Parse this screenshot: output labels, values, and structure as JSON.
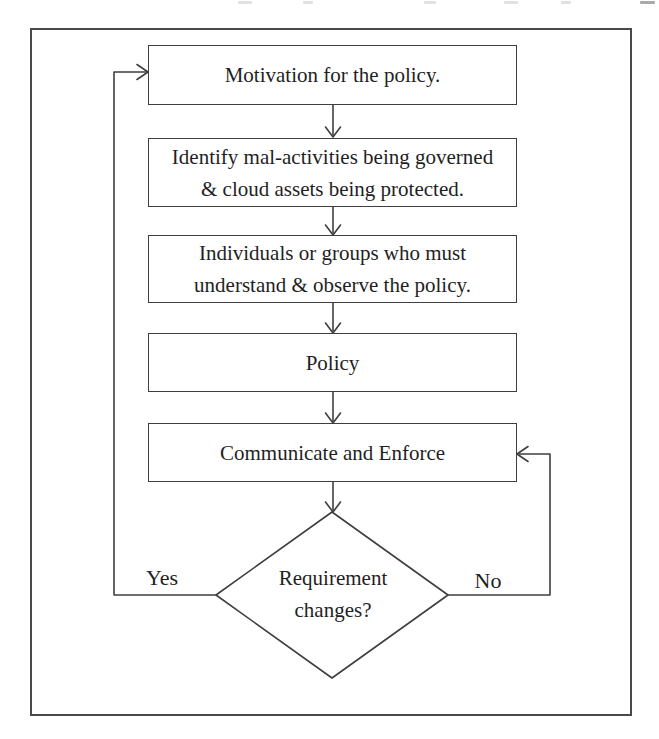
{
  "diagram": {
    "nodes": {
      "motivation": {
        "lines": [
          "Motivation for the policy."
        ]
      },
      "identify": {
        "lines": [
          "Identify mal-activities being governed",
          "& cloud assets being protected."
        ]
      },
      "individuals": {
        "lines": [
          "Individuals or groups who must",
          "understand & observe the policy."
        ]
      },
      "policy": {
        "lines": [
          "Policy"
        ]
      },
      "communicate": {
        "lines": [
          "Communicate and Enforce"
        ]
      },
      "decision": {
        "lines": [
          "Requirement",
          "changes?"
        ]
      }
    },
    "edge_labels": {
      "yes": "Yes",
      "no": "No"
    },
    "edges": [
      {
        "from": "motivation",
        "to": "identify"
      },
      {
        "from": "identify",
        "to": "individuals"
      },
      {
        "from": "individuals",
        "to": "policy"
      },
      {
        "from": "policy",
        "to": "communicate"
      },
      {
        "from": "communicate",
        "to": "decision"
      },
      {
        "from": "decision",
        "to": "motivation",
        "label": "Yes"
      },
      {
        "from": "decision",
        "to": "communicate",
        "label": "No"
      }
    ],
    "colors": {
      "line": "#3f3f3f",
      "frame": "#4a4a4a",
      "text": "#1f1f1f",
      "background": "#ffffff"
    }
  }
}
